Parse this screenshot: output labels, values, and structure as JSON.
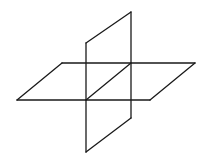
{
  "diagram": {
    "title": "",
    "stroke_color": "#1a1a1a",
    "background_color": "#ffffff",
    "shapes": [
      {
        "name": "horizontal-plane",
        "type": "parallelogram"
      },
      {
        "name": "vertical-plane",
        "type": "parallelogram"
      },
      {
        "name": "intersection-line",
        "type": "line"
      }
    ]
  }
}
